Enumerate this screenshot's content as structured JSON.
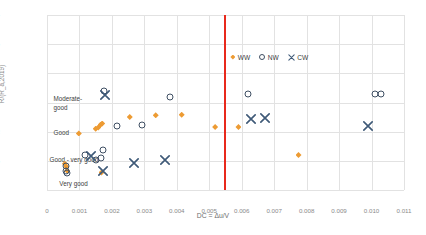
{
  "chart_data": {
    "type": "scatter",
    "title": "",
    "xlabel": "DC = Δu/V",
    "ylabel": "R/(R_a,2019)",
    "xlim": [
      0,
      0.011
    ],
    "ylim": [
      1,
      4
    ],
    "xticks": [
      "0",
      "0.001",
      "0.002",
      "0.003",
      "0.004",
      "0.005",
      "0.006",
      "0.007",
      "0.008",
      "0.009",
      "0.010",
      "0.011"
    ],
    "xtick_values": [
      0,
      0.001,
      0.002,
      0.003,
      0.004,
      0.005,
      0.006,
      0.007,
      0.008,
      0.009,
      0.01,
      0.011
    ],
    "yticks": [
      "1",
      "1.5",
      "2",
      "2.5",
      "3",
      "3.5",
      "4"
    ],
    "ytick_values": [
      1,
      1.5,
      2,
      2.5,
      3,
      3.5,
      4
    ],
    "grid": true,
    "legend_position": "top-right",
    "series": [
      {
        "name": "WW",
        "marker": "diamond",
        "color": "#ed9b33",
        "points": [
          [
            0.00055,
            1.45
          ],
          [
            0.0006,
            1.4
          ],
          [
            0.00062,
            1.33
          ],
          [
            0.00098,
            1.97
          ],
          [
            0.0015,
            2.05
          ],
          [
            0.00158,
            2.07
          ],
          [
            0.00165,
            2.12
          ],
          [
            0.0017,
            2.14
          ],
          [
            0.00168,
            1.3
          ],
          [
            0.00255,
            2.25
          ],
          [
            0.00335,
            2.28
          ],
          [
            0.00415,
            2.29
          ],
          [
            0.00518,
            2.08
          ],
          [
            0.0059,
            2.08
          ],
          [
            0.00775,
            1.6
          ]
        ]
      },
      {
        "name": "NW",
        "marker": "circle-open",
        "color": "#3f4f63",
        "points": [
          [
            0.00058,
            1.42
          ],
          [
            0.0006,
            1.32
          ],
          [
            0.00062,
            1.3
          ],
          [
            0.00118,
            1.6
          ],
          [
            0.0015,
            1.52
          ],
          [
            0.00165,
            1.55
          ],
          [
            0.00172,
            1.68
          ],
          [
            0.00175,
            2.7
          ],
          [
            0.00215,
            2.1
          ],
          [
            0.00293,
            2.12
          ],
          [
            0.00378,
            2.6
          ],
          [
            0.0062,
            2.65
          ],
          [
            0.0101,
            2.65
          ],
          [
            0.0103,
            2.65
          ]
        ]
      },
      {
        "name": "CW",
        "marker": "x",
        "color": "#3f5a78",
        "points": [
          [
            0.00135,
            1.58
          ],
          [
            0.00172,
            1.33
          ],
          [
            0.0018,
            2.63
          ],
          [
            0.00268,
            1.47
          ],
          [
            0.00365,
            1.52
          ],
          [
            0.00628,
            2.22
          ],
          [
            0.00672,
            2.23
          ],
          [
            0.0099,
            2.1
          ]
        ]
      }
    ],
    "threshold_line": {
      "x": 0.00545,
      "color": "#e8291c",
      "orientation": "vertical"
    },
    "region_labels": [
      {
        "text": "Moderate-",
        "x": 0.0002,
        "y": 2.56
      },
      {
        "text": "good",
        "x": 0.0002,
        "y": 2.4
      },
      {
        "text": "Good",
        "x": 0.0002,
        "y": 1.97
      },
      {
        "text": "Good - very good",
        "x": 8e-05,
        "y": 1.52
      },
      {
        "text": "Very good",
        "x": 0.00038,
        "y": 1.1
      }
    ]
  },
  "legend": {
    "items": [
      {
        "label": "WW",
        "symbol": "diamond-icon"
      },
      {
        "label": "NW",
        "symbol": "circle-open-icon"
      },
      {
        "label": "CW",
        "symbol": "x-cross-icon"
      }
    ]
  }
}
